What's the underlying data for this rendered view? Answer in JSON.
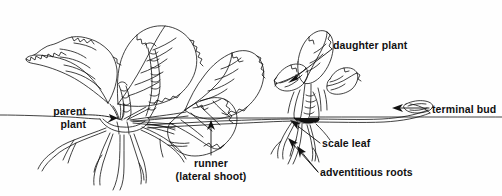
{
  "diagram": {
    "type": "botanical-line-drawing",
    "ink_color": "#111111",
    "background_color": "#ffffff",
    "ground_line_y": 118
  },
  "labels": {
    "parent_plant": {
      "line1": "parent",
      "line2": "plant"
    },
    "runner": {
      "line1": "runner",
      "line2": "(lateral shoot)"
    },
    "daughter_plant": "daughter plant",
    "terminal_bud": "terminal bud",
    "scale_leaf": "scale leaf",
    "adventitious_roots": "adventitious roots"
  },
  "parts": [
    {
      "name": "parent-plant",
      "label": "parent plant"
    },
    {
      "name": "runner",
      "label": "runner (lateral shoot)"
    },
    {
      "name": "daughter-plant",
      "label": "daughter plant"
    },
    {
      "name": "terminal-bud",
      "label": "terminal bud"
    },
    {
      "name": "scale-leaf",
      "label": "scale leaf"
    },
    {
      "name": "adventitious-roots",
      "label": "adventitious roots"
    }
  ]
}
